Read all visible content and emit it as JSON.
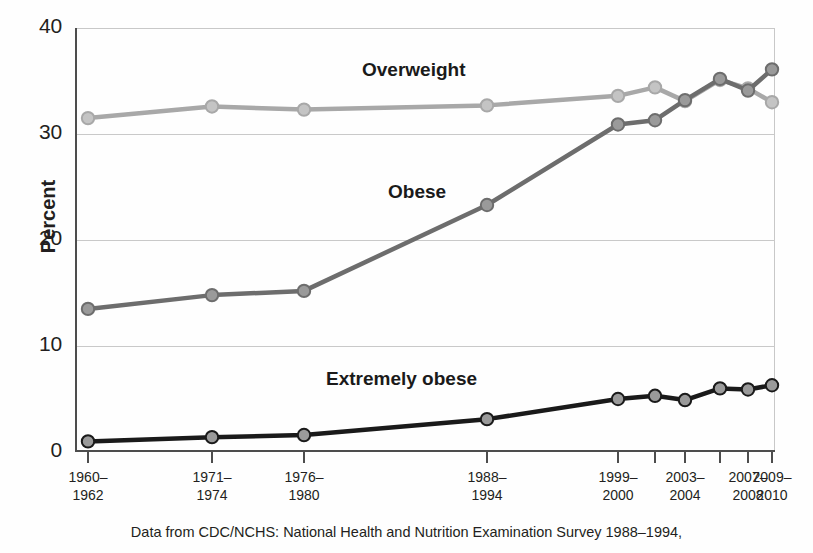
{
  "chart_data": {
    "type": "line",
    "title": "",
    "xlabel": "",
    "ylabel": "Percent",
    "ylim": [
      0,
      40
    ],
    "yticks": [
      0,
      10,
      20,
      30,
      40
    ],
    "grid": true,
    "legend_position": "inline-annotations",
    "categories": [
      "1960-1962",
      "1971-1974",
      "1976-1980",
      "1988-1994",
      "1999-2000",
      "2001-2002",
      "2003-2004",
      "2005-2006",
      "2007-2008",
      "2009-2010"
    ],
    "tick_labels": [
      {
        "index": 0,
        "line1": "1960–",
        "line2": "1962"
      },
      {
        "index": 1,
        "line1": "1971–",
        "line2": "1974"
      },
      {
        "index": 2,
        "line1": "1976–",
        "line2": "1980"
      },
      {
        "index": 3,
        "line1": "1988–",
        "line2": "1994"
      },
      {
        "index": 4,
        "line1": "1999–",
        "line2": "2000"
      },
      {
        "index": 6,
        "line1": "2003–",
        "line2": "2004"
      },
      {
        "index": 8,
        "line1": "2007–",
        "line2": "2008"
      },
      {
        "index": 9,
        "line1": "2009–",
        "line2": "2010"
      }
    ],
    "series": [
      {
        "name": "Overweight",
        "color": "#a8a8a8",
        "marker_fill": "#c4c4c4",
        "values": [
          31.5,
          32.6,
          32.3,
          32.7,
          33.6,
          34.4,
          33.1,
          35.1,
          34.3,
          33.0
        ]
      },
      {
        "name": "Obese",
        "color": "#6d6d6d",
        "marker_fill": "#9a9a9a",
        "values": [
          13.5,
          14.8,
          15.2,
          23.3,
          30.9,
          31.3,
          33.2,
          35.2,
          34.1,
          36.1
        ]
      },
      {
        "name": "Extremely obese",
        "color": "#1a1a1a",
        "marker_fill": "#9a9a9a",
        "values": [
          1.0,
          1.4,
          1.6,
          3.1,
          5.0,
          5.3,
          4.9,
          6.0,
          5.9,
          6.3
        ]
      }
    ],
    "annotations": [
      {
        "name": "Overweight",
        "x_px": 362,
        "y_px": 59
      },
      {
        "name": "Obese",
        "x_px": 388,
        "y_px": 181
      },
      {
        "name": "Extremely obese",
        "x_px": 326,
        "y_px": 368
      }
    ]
  },
  "axis": {
    "y_title": "Percent",
    "y_tick_labels": [
      "40",
      "30",
      "20",
      "10",
      "0"
    ]
  },
  "footer": {
    "line1": "Data from CDC/NCHS: National Health and Nutrition Examination Survey 1988–1994,",
    "line2": ""
  }
}
